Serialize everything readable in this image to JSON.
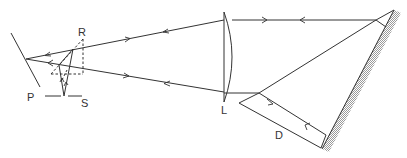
{
  "diagram": {
    "type": "optical ray diagram",
    "labels": {
      "P": "P",
      "R": "R",
      "S": "S",
      "L": "L",
      "D": "D"
    },
    "components": [
      {
        "id": "P",
        "kind": "plane mirror"
      },
      {
        "id": "R",
        "kind": "reference point (dashed construction)"
      },
      {
        "id": "S",
        "kind": "slit / source"
      },
      {
        "id": "L",
        "kind": "plano-convex lens"
      },
      {
        "id": "D",
        "kind": "parallel beam region"
      },
      {
        "id": "mirror",
        "kind": "hatched plane mirror"
      }
    ],
    "colors": {
      "line": "#333333",
      "background": "#ffffff"
    }
  }
}
